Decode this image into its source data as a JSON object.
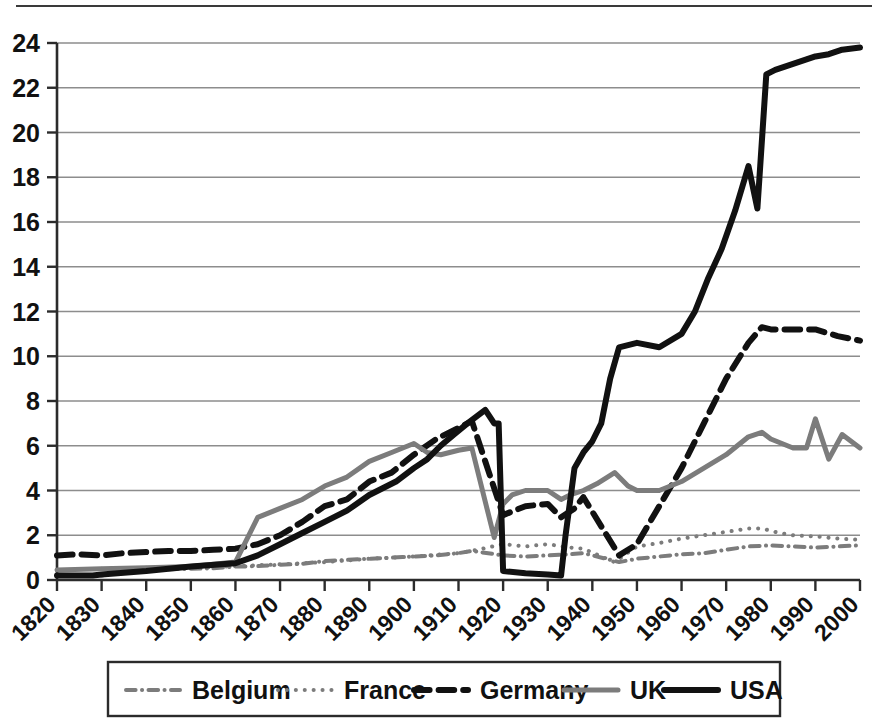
{
  "figure": {
    "background_color": "#ffffff",
    "has_top_rule": true,
    "top_rule_color": "#3a3a3a"
  },
  "chart_data": {
    "type": "line",
    "title": "",
    "subtitle": "",
    "xlabel": "",
    "ylabel": "",
    "xlim": [
      1820,
      2000
    ],
    "ylim": [
      0,
      24
    ],
    "ytick_step": 2,
    "xtick_step": 10,
    "grid": "horizontal",
    "grid_color": "#8d8d8d",
    "legend_position": "bottom",
    "xticks": [
      1820,
      1830,
      1840,
      1850,
      1860,
      1870,
      1880,
      1890,
      1900,
      1910,
      1920,
      1930,
      1940,
      1950,
      1960,
      1970,
      1980,
      1990,
      2000
    ],
    "xtick_labels": [
      "1820",
      "1830",
      "1840",
      "1850",
      "1860",
      "1870",
      "1880",
      "1890",
      "1900",
      "1910",
      "1920",
      "1930",
      "1940",
      "1950",
      "1960",
      "1970",
      "1980",
      "1990",
      "2000"
    ],
    "xtick_rotation_deg": -45,
    "yticks": [
      0,
      2,
      4,
      6,
      8,
      10,
      12,
      14,
      16,
      18,
      20,
      22,
      24
    ],
    "ytick_labels": [
      "0",
      "2",
      "4",
      "6",
      "8",
      "10",
      "12",
      "14",
      "16",
      "18",
      "20",
      "22",
      "24"
    ],
    "series": [
      {
        "name": "Belgium",
        "color": "#7c7c7c",
        "style": "dashdot",
        "width": 4,
        "x": [
          1830,
          1835,
          1840,
          1845,
          1850,
          1855,
          1860,
          1865,
          1870,
          1875,
          1880,
          1885,
          1890,
          1895,
          1900,
          1905,
          1910,
          1913,
          1920,
          1925,
          1930,
          1935,
          1938,
          1946,
          1950,
          1955,
          1960,
          1965,
          1970,
          1975,
          1980,
          1985,
          1990,
          1995,
          2000
        ],
        "values": [
          0.2,
          0.45,
          0.5,
          0.48,
          0.5,
          0.52,
          0.6,
          0.62,
          0.68,
          0.72,
          0.85,
          0.9,
          0.95,
          1.0,
          1.05,
          1.1,
          1.2,
          1.3,
          1.1,
          1.05,
          1.1,
          1.15,
          1.2,
          0.8,
          0.95,
          1.05,
          1.15,
          1.2,
          1.35,
          1.5,
          1.55,
          1.5,
          1.45,
          1.5,
          1.55
        ]
      },
      {
        "name": "France",
        "color": "#7c7c7c",
        "style": "dotted",
        "width": 4,
        "x": [
          1830,
          1840,
          1850,
          1860,
          1870,
          1880,
          1890,
          1900,
          1910,
          1913,
          1920,
          1925,
          1930,
          1935,
          1938,
          1945,
          1950,
          1955,
          1960,
          1965,
          1970,
          1975,
          1978,
          1982,
          1985,
          1990,
          1995,
          2000
        ],
        "values": [
          0.5,
          0.55,
          0.55,
          0.62,
          0.7,
          0.8,
          0.95,
          1.05,
          1.2,
          1.3,
          1.6,
          1.5,
          1.6,
          1.45,
          1.4,
          0.8,
          1.5,
          1.65,
          1.85,
          2.0,
          2.15,
          2.3,
          2.3,
          2.1,
          2.0,
          1.95,
          1.85,
          1.8
        ]
      },
      {
        "name": "Germany",
        "color": "#111111",
        "style": "dashed",
        "width": 6,
        "x": [
          1820,
          1825,
          1830,
          1835,
          1840,
          1845,
          1850,
          1855,
          1860,
          1865,
          1870,
          1875,
          1880,
          1885,
          1890,
          1895,
          1900,
          1905,
          1910,
          1913,
          1920,
          1925,
          1930,
          1933,
          1936,
          1938,
          1946,
          1950,
          1955,
          1960,
          1965,
          1970,
          1975,
          1978,
          1980,
          1985,
          1990,
          1995,
          2000
        ],
        "values": [
          1.1,
          1.15,
          1.1,
          1.2,
          1.25,
          1.3,
          1.3,
          1.35,
          1.4,
          1.6,
          2.0,
          2.6,
          3.3,
          3.6,
          4.4,
          4.8,
          5.6,
          6.3,
          6.8,
          7.1,
          2.9,
          3.3,
          3.4,
          2.8,
          3.2,
          3.7,
          1.1,
          1.6,
          3.3,
          5.0,
          7.0,
          9.0,
          10.6,
          11.3,
          11.2,
          11.2,
          11.2,
          10.9,
          10.7
        ]
      },
      {
        "name": "UK",
        "color": "#7c7c7c",
        "style": "solid",
        "width": 5,
        "x": [
          1820,
          1830,
          1840,
          1850,
          1860,
          1865,
          1870,
          1875,
          1880,
          1885,
          1890,
          1895,
          1900,
          1903,
          1906,
          1910,
          1913,
          1918,
          1920,
          1922,
          1925,
          1930,
          1933,
          1935,
          1938,
          1941,
          1945,
          1948,
          1950,
          1955,
          1960,
          1965,
          1970,
          1975,
          1978,
          1980,
          1985,
          1988,
          1990,
          1993,
          1996,
          2000
        ],
        "values": [
          0.45,
          0.5,
          0.55,
          0.6,
          0.8,
          2.8,
          3.2,
          3.6,
          4.2,
          4.6,
          5.3,
          5.7,
          6.1,
          5.7,
          5.6,
          5.8,
          5.9,
          1.9,
          3.4,
          3.8,
          4.0,
          4.0,
          3.6,
          3.8,
          4.0,
          4.3,
          4.8,
          4.2,
          4.0,
          4.0,
          4.4,
          5.0,
          5.6,
          6.4,
          6.6,
          6.3,
          5.9,
          5.9,
          7.2,
          5.4,
          6.5,
          5.9
        ]
      },
      {
        "name": "USA",
        "color": "#111111",
        "style": "solid",
        "width": 6,
        "x": [
          1820,
          1828,
          1830,
          1840,
          1850,
          1860,
          1865,
          1870,
          1875,
          1880,
          1885,
          1890,
          1893,
          1896,
          1900,
          1903,
          1906,
          1909,
          1912,
          1914,
          1916,
          1918,
          1919,
          1920,
          1925,
          1930,
          1933,
          1934,
          1936,
          1938,
          1940,
          1942,
          1944,
          1946,
          1950,
          1955,
          1960,
          1963,
          1966,
          1969,
          1972,
          1975,
          1977,
          1979,
          1981,
          1984,
          1987,
          1990,
          1993,
          1996,
          2000
        ],
        "values": [
          0.2,
          0.2,
          0.25,
          0.4,
          0.6,
          0.75,
          1.1,
          1.6,
          2.1,
          2.6,
          3.1,
          3.8,
          4.1,
          4.4,
          5.0,
          5.4,
          6.0,
          6.5,
          7.0,
          7.3,
          7.6,
          7.0,
          7.0,
          0.4,
          0.3,
          0.25,
          0.2,
          2.0,
          5.0,
          5.7,
          6.2,
          7.0,
          9.0,
          10.4,
          10.6,
          10.4,
          11.0,
          12.0,
          13.5,
          14.8,
          16.5,
          18.5,
          16.6,
          22.6,
          22.8,
          23.0,
          23.2,
          23.4,
          23.5,
          23.7,
          23.8
        ]
      }
    ]
  },
  "legend": {
    "entries": [
      {
        "label": "Belgium",
        "swatch": "dashdot-swatch",
        "color": "#7c7c7c"
      },
      {
        "label": "France",
        "swatch": "dotted-swatch",
        "color": "#7c7c7c"
      },
      {
        "label": "Germany",
        "swatch": "dashed-swatch",
        "color": "#111111"
      },
      {
        "label": "UK",
        "swatch": "solid-gray-swatch",
        "color": "#7c7c7c"
      },
      {
        "label": "USA",
        "swatch": "solid-black-swatch",
        "color": "#111111"
      }
    ],
    "border_color": "#2b2b2b"
  }
}
